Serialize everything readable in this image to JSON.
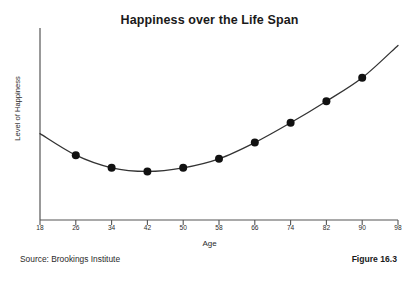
{
  "figure": {
    "title": "Happiness over the Life Span",
    "source_note": "Source: Brookings Institute",
    "figure_number": "Figure 16.3"
  },
  "colors": {
    "axis": "#555555",
    "line": "#333333",
    "marker": "#111111",
    "text": "#2b2b2b",
    "background": "#ffffff"
  },
  "chart_data": {
    "type": "line",
    "title": "Happiness over the Life Span",
    "xlabel": "Age",
    "ylabel": "Level of Happiness",
    "xlim": [
      18,
      98
    ],
    "ylim": [
      0,
      100
    ],
    "grid": false,
    "legend": null,
    "xticks": [
      18,
      26,
      34,
      42,
      50,
      58,
      66,
      74,
      82,
      90,
      98
    ],
    "xtick_labels": [
      "18",
      "26",
      "34",
      "42",
      "50",
      "58",
      "66",
      "74",
      "82",
      "90",
      "98"
    ],
    "yticks": [],
    "ytick_labels": [],
    "markers": "filled-circle",
    "x": [
      26,
      34,
      42,
      50,
      58,
      66,
      74,
      82,
      90
    ],
    "values": [
      36,
      29,
      27,
      29,
      34,
      43,
      54,
      66,
      79
    ],
    "curve_endpoints": {
      "left": {
        "x": 18,
        "y": 48
      },
      "right": {
        "x": 98,
        "y": 97
      }
    },
    "series": [
      {
        "name": "Level of Happiness",
        "x": [
          26,
          34,
          42,
          50,
          58,
          66,
          74,
          82,
          90
        ],
        "values": [
          36,
          29,
          27,
          29,
          34,
          43,
          54,
          66,
          79
        ]
      }
    ]
  }
}
